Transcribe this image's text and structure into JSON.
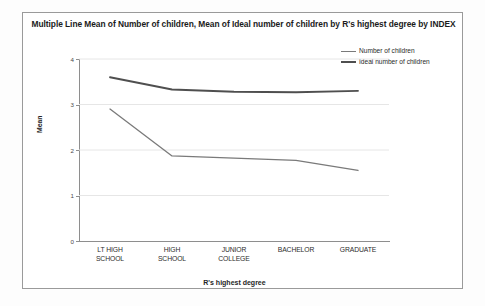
{
  "chart_data": {
    "type": "line",
    "title": "Multiple Line Mean of Number of children, Mean of Ideal number of children by R's highest degree by INDEX",
    "xlabel": "R's highest degree",
    "ylabel": "Mean",
    "categories": [
      "LT HIGH SCHOOL",
      "HIGH SCHOOL",
      "JUNIOR COLLEGE",
      "BACHELOR",
      "GRADUATE"
    ],
    "category_lines": [
      [
        "LT HIGH",
        "SCHOOL"
      ],
      [
        "HIGH",
        "SCHOOL"
      ],
      [
        "JUNIOR",
        "COLLEGE"
      ],
      [
        "BACHELOR",
        ""
      ],
      [
        "GRADUATE",
        ""
      ]
    ],
    "series": [
      {
        "name": "Number of children",
        "color": "#7a7a7a",
        "width": 1.3,
        "values": [
          2.9,
          1.87,
          1.82,
          1.77,
          1.55
        ]
      },
      {
        "name": "Ideal number of children",
        "color": "#4f4f4f",
        "width": 1.9,
        "values": [
          3.6,
          3.33,
          3.28,
          3.27,
          3.3
        ]
      }
    ],
    "ylim": [
      0,
      4
    ],
    "yticks": [
      0,
      1,
      2,
      3,
      4
    ],
    "ytick_labels": [
      "0",
      "1",
      "2",
      "3",
      "4"
    ],
    "grid": true,
    "grid_color": "#e6e6e6",
    "legend_position": "top-right"
  }
}
